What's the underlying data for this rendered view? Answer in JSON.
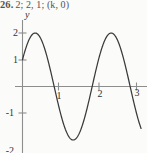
{
  "answer_line": {
    "number": "26.",
    "answer": "2; 2, 1; (k, 0)"
  },
  "figure": {
    "y_axis_label": "y",
    "x_axis_label": ""
  },
  "chart_data": {
    "type": "line",
    "title": "",
    "subtitle": "",
    "xlabel": "",
    "ylabel": "y",
    "xlim": [
      0,
      3.12
    ],
    "ylim": [
      -2.3,
      2.3
    ],
    "grid": false,
    "legend": null,
    "x_ticks": [
      1,
      2,
      3
    ],
    "x_tick_labels": [
      "1",
      "2",
      "3"
    ],
    "y_ticks": [
      2,
      1,
      -1,
      -2
    ],
    "y_tick_labels": [
      "2",
      "1",
      "-1",
      "-2"
    ],
    "axis_origin": [
      0,
      0
    ],
    "function": "y = 2 sin(pi*x + pi/6)",
    "amplitude": 2,
    "period": 2,
    "phase_shift": -0.1667,
    "series": [
      {
        "name": "y = 2 sin(pi*x + pi/6)",
        "color": "#3a3a3a",
        "x": [
          0,
          0.1,
          0.2,
          0.3,
          0.3333,
          0.4,
          0.5,
          0.6,
          0.7,
          0.8,
          0.8333,
          0.9,
          1.0,
          1.1,
          1.2,
          1.3,
          1.3333,
          1.4,
          1.5,
          1.6,
          1.7,
          1.8,
          1.8333,
          1.9,
          2.0,
          2.1,
          2.2,
          2.3,
          2.3333,
          2.4,
          2.5,
          2.6,
          2.7,
          2.8,
          2.8333,
          2.9,
          3.0
        ],
        "y": [
          1.0,
          1.414,
          1.732,
          1.932,
          2.0,
          1.975,
          1.732,
          1.286,
          0.684,
          0.0,
          -0.209,
          -0.618,
          -1.0,
          -1.618,
          -1.902,
          -1.995,
          -2.0,
          -1.902,
          -1.732,
          -1.286,
          -0.684,
          0.0,
          0.209,
          0.618,
          1.0,
          1.618,
          1.902,
          1.995,
          2.0,
          1.902,
          1.732,
          1.286,
          0.684,
          0.0,
          -0.209,
          -0.618,
          -1.0
        ]
      }
    ],
    "zero_crossings": [
      0.8333,
      1.8333,
      2.8333
    ],
    "maxima": [
      [
        0.3333,
        2
      ],
      [
        2.3333,
        2
      ]
    ],
    "minima": [
      [
        1.3333,
        -2
      ]
    ]
  }
}
